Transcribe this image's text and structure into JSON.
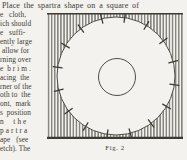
{
  "document": {
    "top_line": "Place the spartra shape on a square of",
    "left_column_lines": [
      "e   cloth,",
      "ich should",
      "e   suffi-",
      "ently large",
      " allow for",
      "rning over",
      "e  b r i m .",
      "acing  the",
      "rner of the",
      "oth to  the",
      "ont,  mark",
      "s  position",
      "n     t h e",
      "p a r t r a",
      "ape   (see",
      "etch). The"
    ],
    "figure": {
      "caption": "Fig. 2",
      "tick_count": 16,
      "description": "Spartra shape: large circle with radial tick marks around its rim and a small concentric circle, drawn on a vertically hatched square of cloth"
    },
    "colors": {
      "paper": "#f3f2ee",
      "ink": "#3c3a33",
      "hatch_line": "#4e4b43"
    }
  }
}
